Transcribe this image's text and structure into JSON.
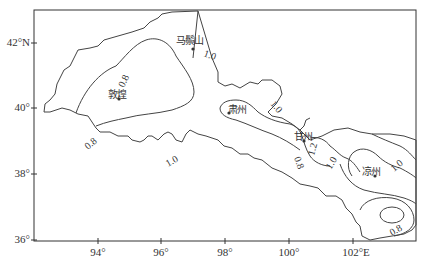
{
  "map": {
    "type": "contour_map",
    "region": "Hexi Corridor",
    "x_axis": {
      "ticks": [
        "94°",
        "96°",
        "98°",
        "100°",
        "102°E"
      ],
      "tick_values": [
        94,
        96,
        98,
        100,
        102
      ],
      "unit": "E"
    },
    "y_axis": {
      "ticks": [
        "42°N",
        "40°",
        "38°",
        "36°"
      ],
      "tick_values": [
        42,
        40,
        38,
        36
      ],
      "unit": "N"
    },
    "places": [
      {
        "name": "马鬃山",
        "lon": 97.0,
        "lat": 41.8
      },
      {
        "name": "敦煌",
        "lon": 94.7,
        "lat": 40.1
      },
      {
        "name": "肃州",
        "lon": 98.5,
        "lat": 39.7
      },
      {
        "name": "甘州",
        "lon": 100.4,
        "lat": 38.9
      },
      {
        "name": "凉州",
        "lon": 102.6,
        "lat": 37.9
      }
    ],
    "contour_labels": [
      {
        "value": "1.0",
        "near": "马鬃山"
      },
      {
        "value": "0.8",
        "near": "敦煌 north"
      },
      {
        "value": "0.8",
        "near": "敦煌 south"
      },
      {
        "value": "1.0",
        "near": "south of 96°"
      },
      {
        "value": "1.0",
        "near": "肃州 north-east"
      },
      {
        "value": "0.8",
        "near": "甘州 south-west"
      },
      {
        "value": "1.2",
        "near": "甘州 east"
      },
      {
        "value": "1.0",
        "near": "甘州 east"
      },
      {
        "value": "1.0",
        "near": "凉州"
      },
      {
        "value": "0.8",
        "near": "south-east corner"
      }
    ],
    "contour_levels": [
      0.8,
      1.0,
      1.2
    ]
  }
}
